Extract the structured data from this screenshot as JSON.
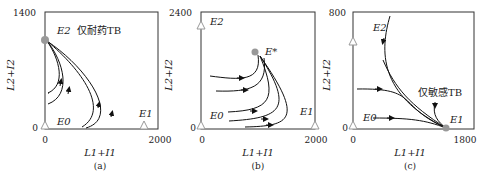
{
  "panels": [
    {
      "id": "a",
      "caption": "(a)",
      "xlabel": "L1+I1",
      "ylabel": "L2+I2",
      "xmin": "0",
      "xmax": "2000",
      "ymin": "0",
      "ymax": "1400",
      "labels": {
        "E2": "E2",
        "E0": "E0",
        "E1": "E1",
        "note": "仅耐药TB"
      }
    },
    {
      "id": "b",
      "caption": "(b)",
      "xlabel": "L1+I1",
      "ylabel": "L2+I2",
      "xmin": "0",
      "xmax": "2000",
      "ymin": "0",
      "ymax": "2400",
      "labels": {
        "E2": "E2",
        "E0": "E0",
        "E1": "E1",
        "Estar": "E*"
      }
    },
    {
      "id": "c",
      "caption": "(c)",
      "xlabel": "L1+I1",
      "ylabel": "L2+I2",
      "xmin": "0",
      "xmax": "1800",
      "ymin": "0",
      "ymax": "800",
      "labels": {
        "E2": "E2",
        "E0": "E0",
        "E1": "E1",
        "note": "仅敏感TB"
      }
    }
  ],
  "colors": {
    "stable": "#999999",
    "curve": "#111111",
    "frame": "#333333"
  }
}
